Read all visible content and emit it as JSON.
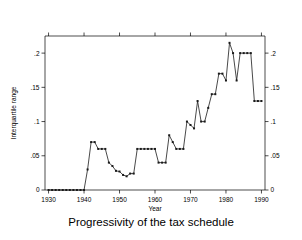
{
  "chart_data": {
    "type": "line",
    "title": "",
    "caption": "Progressivity of the tax schedule",
    "xlabel": "Year",
    "ylabel": "Interquartile range",
    "xlim": [
      1929,
      1991
    ],
    "ylim": [
      0,
      0.225
    ],
    "grid": false,
    "legend": null,
    "x_ticks": [
      1930,
      1940,
      1950,
      1960,
      1970,
      1980,
      1990
    ],
    "x_tick_labels": [
      "1930",
      "1940",
      "1950",
      "1960",
      "1970",
      "1980",
      "1990"
    ],
    "y_ticks": [
      0,
      0.05,
      0.1,
      0.15,
      0.2
    ],
    "y_tick_labels": [
      "0",
      ".05",
      ".1",
      ".15",
      ".2"
    ],
    "right_axis": true,
    "right_y_tick_labels": [
      "0",
      ".05",
      ".1",
      ".15",
      ".2"
    ],
    "marker": "square",
    "x": [
      1930,
      1931,
      1932,
      1933,
      1934,
      1935,
      1936,
      1937,
      1938,
      1939,
      1940,
      1941,
      1942,
      1943,
      1944,
      1945,
      1946,
      1947,
      1948,
      1949,
      1950,
      1951,
      1952,
      1953,
      1954,
      1955,
      1956,
      1957,
      1958,
      1959,
      1960,
      1961,
      1962,
      1963,
      1964,
      1965,
      1966,
      1967,
      1968,
      1969,
      1970,
      1971,
      1972,
      1973,
      1974,
      1975,
      1976,
      1977,
      1978,
      1979,
      1980,
      1981,
      1982,
      1983,
      1984,
      1985,
      1986,
      1987,
      1988,
      1989,
      1990
    ],
    "y": [
      0,
      0,
      0,
      0,
      0,
      0,
      0,
      0,
      0,
      0,
      0,
      0.03,
      0.07,
      0.07,
      0.06,
      0.06,
      0.06,
      0.04,
      0.035,
      0.028,
      0.027,
      0.022,
      0.02,
      0.024,
      0.024,
      0.06,
      0.06,
      0.06,
      0.06,
      0.06,
      0.06,
      0.04,
      0.04,
      0.04,
      0.08,
      0.07,
      0.06,
      0.06,
      0.06,
      0.1,
      0.095,
      0.09,
      0.13,
      0.1,
      0.1,
      0.12,
      0.14,
      0.14,
      0.17,
      0.17,
      0.16,
      0.215,
      0.2,
      0.16,
      0.2,
      0.2,
      0.2,
      0.2,
      0.13,
      0.13,
      0.13
    ]
  },
  "axes": {
    "y_label": "Interquartile range",
    "x_label": "Year"
  },
  "caption": {
    "text": "Progressivity of the tax schedule"
  }
}
